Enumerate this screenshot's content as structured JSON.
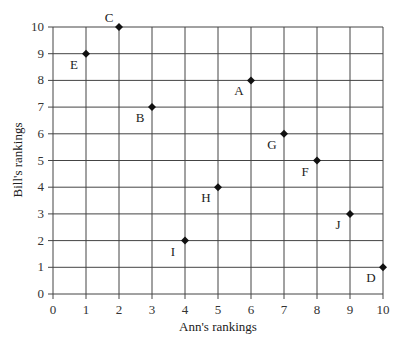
{
  "chart_data": {
    "type": "scatter",
    "title": "",
    "xlabel": "Ann's rankings",
    "ylabel": "Bill's rankings",
    "xlim": [
      0,
      10
    ],
    "ylim": [
      0,
      10
    ],
    "grid": true,
    "xticks": [
      0,
      1,
      2,
      3,
      4,
      5,
      6,
      7,
      8,
      9,
      10
    ],
    "yticks": [
      0,
      1,
      2,
      3,
      4,
      5,
      6,
      7,
      8,
      9,
      10
    ],
    "points": [
      {
        "label": "A",
        "x": 6,
        "y": 8
      },
      {
        "label": "B",
        "x": 3,
        "y": 7
      },
      {
        "label": "C",
        "x": 2,
        "y": 10
      },
      {
        "label": "D",
        "x": 10,
        "y": 1
      },
      {
        "label": "E",
        "x": 1,
        "y": 9
      },
      {
        "label": "F",
        "x": 8,
        "y": 5
      },
      {
        "label": "G",
        "x": 7,
        "y": 6
      },
      {
        "label": "H",
        "x": 5,
        "y": 4
      },
      {
        "label": "I",
        "x": 4,
        "y": 2
      },
      {
        "label": "J",
        "x": 9,
        "y": 3
      }
    ]
  },
  "colors": {
    "grid": "#444444",
    "marker": "#111111",
    "text": "#222222"
  }
}
